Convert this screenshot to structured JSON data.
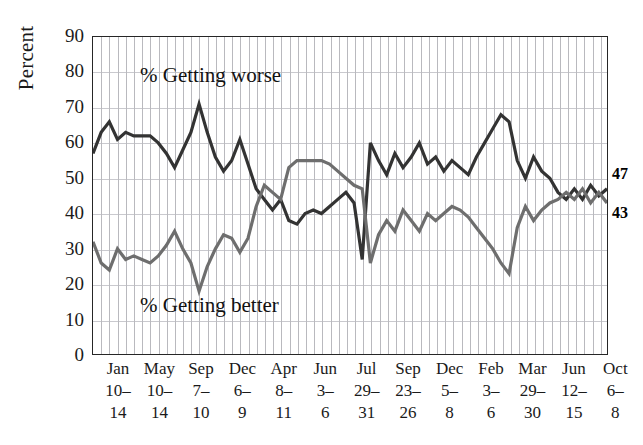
{
  "axis": {
    "ylabel": "Percent",
    "yticks": [
      "90",
      "80",
      "70",
      "60",
      "50",
      "40",
      "30",
      "20",
      "10",
      "0"
    ]
  },
  "annotations": {
    "worse": "% Getting worse",
    "better": "% Getting better"
  },
  "end_labels": {
    "worse": "47",
    "better": "43"
  },
  "colors": {
    "worse_line": "#333333",
    "better_line": "#6e6e6e",
    "grid": "#b9b9be",
    "frame": "#262626"
  },
  "xlabels": [
    {
      "month": "Jan",
      "range": "10–",
      "end": "14"
    },
    {
      "month": "May",
      "range": "10–",
      "end": "14"
    },
    {
      "month": "Sep",
      "range": "7–",
      "end": "10"
    },
    {
      "month": "Dec",
      "range": "6–",
      "end": "9"
    },
    {
      "month": "Apr",
      "range": "8–",
      "end": "11"
    },
    {
      "month": "Jun",
      "range": "3–",
      "end": "6"
    },
    {
      "month": "Jul",
      "range": "29–",
      "end": "31"
    },
    {
      "month": "Sep",
      "range": "23–",
      "end": "26"
    },
    {
      "month": "Dec",
      "range": "5–",
      "end": "8"
    },
    {
      "month": "Feb",
      "range": "3–",
      "end": "6"
    },
    {
      "month": "Mar",
      "range": "29–",
      "end": "30"
    },
    {
      "month": "Jun",
      "range": "12–",
      "end": "15"
    },
    {
      "month": "Oct",
      "range": "6–",
      "end": "8"
    }
  ],
  "chart_data": {
    "type": "line",
    "title": "",
    "xlabel": "",
    "ylabel": "Percent",
    "ylim": [
      0,
      90
    ],
    "ytick_step": 10,
    "grid": true,
    "legend": "inline-annotations",
    "x_tick_labels": [
      "Jan 10–14",
      "May 10–14",
      "Sep 7–10",
      "Dec 6–9",
      "Apr 8–11",
      "Jun 3–6",
      "Jul 29–31",
      "Sep 23–26",
      "Dec 5–8",
      "Feb 3–6",
      "Mar 29–30",
      "Jun 12–15",
      "Oct 6–8"
    ],
    "series": [
      {
        "name": "% Getting worse",
        "color": "#333333",
        "end_value": 47,
        "values": [
          57,
          63,
          66,
          61,
          63,
          62,
          62,
          62,
          60,
          57,
          53,
          58,
          63,
          71,
          63,
          56,
          52,
          55,
          61,
          54,
          47,
          44,
          41,
          44,
          38,
          37,
          40,
          41,
          40,
          42,
          44,
          46,
          43,
          27,
          60,
          55,
          51,
          57,
          53,
          56,
          60,
          54,
          56,
          52,
          55,
          53,
          51,
          56,
          60,
          64,
          68,
          66,
          55,
          50,
          56,
          52,
          50,
          46,
          44,
          47,
          44,
          48,
          45,
          47
        ]
      },
      {
        "name": "% Getting better",
        "color": "#6e6e6e",
        "end_value": 43,
        "values": [
          32,
          26,
          24,
          30,
          27,
          28,
          27,
          26,
          28,
          31,
          35,
          30,
          26,
          18,
          25,
          30,
          34,
          33,
          29,
          33,
          42,
          48,
          46,
          44,
          53,
          55,
          55,
          55,
          55,
          54,
          52,
          50,
          48,
          47,
          26,
          34,
          38,
          35,
          41,
          38,
          35,
          40,
          38,
          40,
          42,
          41,
          39,
          36,
          33,
          30,
          26,
          23,
          36,
          42,
          38,
          41,
          43,
          44,
          46,
          44,
          47,
          43,
          46,
          43
        ]
      }
    ]
  }
}
